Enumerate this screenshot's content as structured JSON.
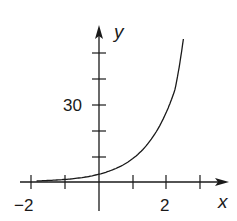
{
  "chart_data": {
    "type": "line",
    "title": "",
    "xlabel": "x",
    "ylabel": "y",
    "x_tick_labels": [
      "-2",
      "2"
    ],
    "y_tick_labels": [
      "30"
    ],
    "x_ticks": [
      -2,
      -1,
      0,
      1,
      2,
      3
    ],
    "y_ticks": [
      10,
      20,
      30,
      40,
      50
    ],
    "xlim": [
      -2.2,
      3.5
    ],
    "ylim": [
      -3,
      62
    ],
    "grid": false,
    "legend": null,
    "series": [
      {
        "name": "y = f(x)",
        "x": [
          -1.85,
          -1.5,
          -1,
          -0.5,
          0,
          0.5,
          1,
          1.5,
          2,
          2.25,
          2.5
        ],
        "values": [
          0.4,
          0.6,
          1.0,
          1.7,
          3.0,
          5.2,
          9.0,
          15.6,
          27.0,
          35.5,
          55.0
        ]
      }
    ]
  },
  "labels": {
    "x_axis": "x",
    "y_axis": "y",
    "x_tick_neg2": "−2",
    "x_tick_2": "2",
    "y_tick_30": "30"
  }
}
